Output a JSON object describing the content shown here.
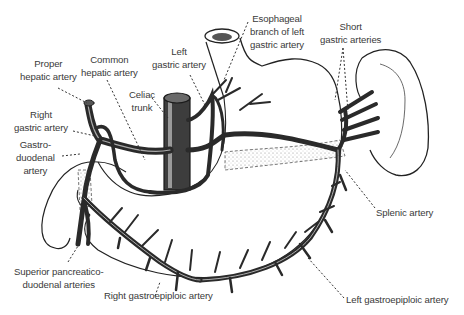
{
  "figure": {
    "colors": {
      "background": "#ffffff",
      "ink": "#222222",
      "label_text": "#3a3a3a",
      "vessel_fill": "#4a4a4a",
      "vessel_highlight": "#cfcfcf",
      "pancreas_stipple": "#bdbdbd"
    }
  },
  "labels": {
    "proper_hepatic": {
      "line1": "Proper",
      "line2": "hepatic artery"
    },
    "common_hepatic": {
      "line1": "Common",
      "line2": "hepatic artery"
    },
    "left_gastric": {
      "line1": "Left",
      "line2": "gastric artery"
    },
    "esophageal_branch": {
      "line1": "Esophageal",
      "line2": "branch of left",
      "line3": "gastric artery"
    },
    "short_gastric": {
      "line1": "Short",
      "line2": "gastric arteries"
    },
    "celiac_trunk": {
      "line1": "Celiac",
      "line2": "trunk"
    },
    "right_gastric": {
      "line1": "Right",
      "line2": "gastric artery"
    },
    "gastroduodenal": {
      "line1": "Gastro-",
      "line2": "duodenal",
      "line3": "artery"
    },
    "splenic": {
      "line1": "Splenic artery"
    },
    "superior_pancreaticoduodenal": {
      "line1": "Superior pancreatico-",
      "line2": "duodenal arteries"
    },
    "right_gastroepiploic": {
      "line1": "Right gastroepiploic artery"
    },
    "left_gastroepiploic": {
      "line1": "Left gastroepiploic artery"
    }
  },
  "structures": [
    "esophagus",
    "stomach",
    "duodenum",
    "pancreas",
    "spleen",
    "aorta"
  ]
}
